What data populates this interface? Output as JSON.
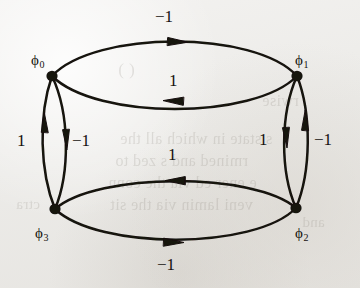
{
  "figure": {
    "kind": "directed-multigraph",
    "background_color": "#efeeec",
    "ink_color": "#15120f",
    "nodes": [
      {
        "id": "phi0",
        "name": "ϕ",
        "subscript": "0",
        "x": 52,
        "y": 76,
        "label_x": 31,
        "label_y": 53
      },
      {
        "id": "phi1",
        "name": "ϕ",
        "subscript": "1",
        "x": 297,
        "y": 76,
        "label_x": 295,
        "label_y": 53
      },
      {
        "id": "phi2",
        "name": "ϕ",
        "subscript": "2",
        "x": 296,
        "y": 208,
        "label_x": 295,
        "label_y": 226
      },
      {
        "id": "phi3",
        "name": "ϕ",
        "subscript": "3",
        "x": 55,
        "y": 209,
        "label_x": 35,
        "label_y": 226
      }
    ],
    "edges": [
      {
        "id": "e-top-outer",
        "from": "phi1",
        "to": "phi0",
        "weight": "−1",
        "direction": "left",
        "label_x": 155,
        "label_y": 8
      },
      {
        "id": "e-top-inner",
        "from": "phi0",
        "to": "phi1",
        "weight": "1",
        "direction": "right",
        "label_x": 169,
        "label_y": 72
      },
      {
        "id": "e-left-outer",
        "from": "phi3",
        "to": "phi0",
        "weight": "1",
        "direction": "up",
        "label_x": 17,
        "label_y": 132
      },
      {
        "id": "e-left-inner",
        "from": "phi0",
        "to": "phi3",
        "weight": "−1",
        "direction": "down",
        "label_x": 72,
        "label_y": 132
      },
      {
        "id": "e-right-inner",
        "from": "phi1",
        "to": "phi2",
        "weight": "1",
        "direction": "down",
        "label_x": 259,
        "label_y": 131
      },
      {
        "id": "e-right-outer",
        "from": "phi2",
        "to": "phi1",
        "weight": "−1",
        "direction": "up",
        "label_x": 314,
        "label_y": 131
      },
      {
        "id": "e-bottom-inner",
        "from": "phi2",
        "to": "phi3",
        "weight": "1",
        "direction": "left",
        "label_x": 168,
        "label_y": 146
      },
      {
        "id": "e-bottom-outer",
        "from": "phi3",
        "to": "phi2",
        "weight": "−1",
        "direction": "right",
        "label_x": 157,
        "label_y": 256
      }
    ],
    "bleed_text": [
      {
        "text": "( )",
        "x": 118,
        "y": 60,
        "size": 17
      },
      {
        "text": "rwise",
        "x": 262,
        "y": 92,
        "size": 16
      },
      {
        "text": "s  state in which all the",
        "x": 120,
        "y": 130,
        "size": 16
      },
      {
        "text": "rmined  and  s  zed  to",
        "x": 115,
        "y": 152,
        "size": 16
      },
      {
        "text": "e  ener  ed  via the conn",
        "x": 108,
        "y": 174,
        "size": 16
      },
      {
        "text": "veni  lamin  via the sit",
        "x": 110,
        "y": 196,
        "size": 16
      },
      {
        "text": "ctra",
        "x": 16,
        "y": 196,
        "size": 15
      },
      {
        "text": "and",
        "x": 302,
        "y": 214,
        "size": 15
      }
    ]
  }
}
